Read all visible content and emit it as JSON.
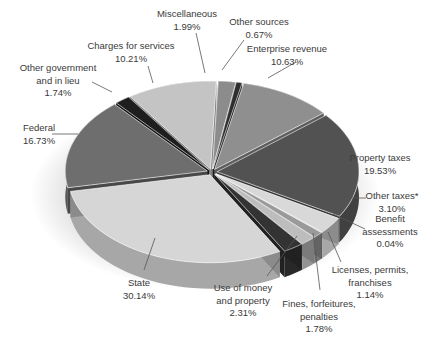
{
  "chart_data": {
    "type": "pie",
    "style": "3d-exploded",
    "title": "",
    "slices": [
      {
        "label": "Miscellaneous",
        "value": 1.99,
        "display": "1.99%",
        "color": "#8c8c8c"
      },
      {
        "label": "Other sources",
        "value": 0.67,
        "display": "0.67%",
        "color": "#2e2e2e"
      },
      {
        "label": "Enterprise revenue",
        "value": 10.63,
        "display": "10.63%",
        "color": "#8f8f8f"
      },
      {
        "label": "Property taxes",
        "value": 19.53,
        "display": "19.53%",
        "color": "#525252"
      },
      {
        "label": "Other taxes*",
        "value": 3.1,
        "display": "3.10%",
        "color": "#d8d8d8"
      },
      {
        "label": "Benefit assessments",
        "value": 0.04,
        "display": "0.04%",
        "color": "#3a3a3a"
      },
      {
        "label": "Licenses, permits, franchises",
        "value": 1.14,
        "display": "1.14%",
        "color": "#9a9a9a"
      },
      {
        "label": "Fines, forfeitures, penalties",
        "value": 1.78,
        "display": "1.78%",
        "color": "#bdbdbd"
      },
      {
        "label": "Use of money and property",
        "value": 2.31,
        "display": "2.31%",
        "color": "#333333"
      },
      {
        "label": "State",
        "value": 30.14,
        "display": "30.14%",
        "color": "#d6d6d6"
      },
      {
        "label": "Federal",
        "value": 16.73,
        "display": "16.73%",
        "color": "#6e6e6e"
      },
      {
        "label": "Other government and in lieu",
        "value": 1.74,
        "display": "1.74%",
        "color": "#1e1e1e"
      },
      {
        "label": "Charges for services",
        "value": 10.21,
        "display": "10.21%",
        "color": "#c4c4c4"
      }
    ],
    "legend": "none (callout labels)"
  },
  "labels": [
    {
      "lines": [
        "Miscellaneous",
        "1.99%"
      ],
      "x": 187,
      "y": 8,
      "ax": 205,
      "ay": 73,
      "lx": 196,
      "ly": 33
    },
    {
      "lines": [
        "Other sources",
        "0.67%"
      ],
      "x": 259,
      "y": 16,
      "ax": 222,
      "ay": 70,
      "lx": 244,
      "ly": 40
    },
    {
      "lines": [
        "Enterprise revenue",
        "10.63%"
      ],
      "x": 287,
      "y": 43,
      "ax": 268,
      "ay": 78,
      "lx": 296,
      "ly": 62
    },
    {
      "lines": [
        "Property taxes",
        "19.53%"
      ],
      "x": 380,
      "y": 152,
      "ax": 350,
      "ay": 168,
      "lx": 355,
      "ly": 168
    },
    {
      "lines": [
        "Other taxes*",
        "3.10%"
      ],
      "x": 392,
      "y": 190,
      "ax": 340,
      "ay": 198,
      "lx": 366,
      "ly": 198
    },
    {
      "lines": [
        "Benefit",
        "assessments",
        "0.04%"
      ],
      "x": 390,
      "y": 213,
      "ax": 333,
      "ay": 214,
      "lx": 365,
      "ly": 229
    },
    {
      "lines": [
        "Licenses, permits,",
        "franchises",
        "1.14%"
      ],
      "x": 370,
      "y": 264,
      "ax": 328,
      "ay": 232,
      "lx": 341,
      "ly": 262
    },
    {
      "lines": [
        "Fines, forfeitures,",
        "penalties",
        "1.78%"
      ],
      "x": 319,
      "y": 298,
      "ax": 313,
      "ay": 233,
      "lx": 320,
      "ly": 290
    },
    {
      "lines": [
        "Use of money",
        "and property",
        "2.31%"
      ],
      "x": 243,
      "y": 282,
      "ax": 297,
      "ay": 236,
      "lx": 267,
      "ly": 276
    },
    {
      "lines": [
        "State",
        "30.14%"
      ],
      "x": 139,
      "y": 277,
      "ax": 155,
      "ay": 238,
      "lx": 144,
      "ly": 270
    },
    {
      "lines": [
        "Federal",
        "16.73%"
      ],
      "x": 39,
      "y": 122,
      "ax": 78,
      "ay": 134,
      "lx": 52,
      "ly": 134
    },
    {
      "lines": [
        "Other government",
        "and in lieu",
        "1.74%"
      ],
      "x": 58,
      "y": 62,
      "ax": 112,
      "ay": 92,
      "lx": 92,
      "ly": 82
    },
    {
      "lines": [
        "Charges for services",
        "10.21%"
      ],
      "x": 131,
      "y": 40,
      "ax": 153,
      "ay": 83,
      "lx": 148,
      "ly": 66
    }
  ]
}
